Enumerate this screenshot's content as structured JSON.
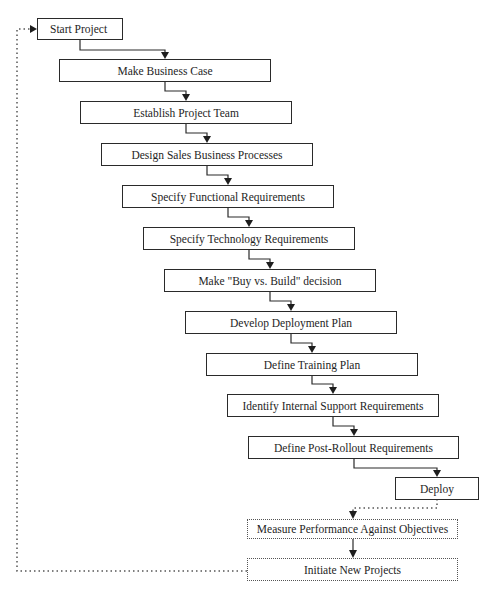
{
  "diagram": {
    "type": "flowchart",
    "steps": [
      {
        "id": "start",
        "label": "Start Project",
        "style": "solid"
      },
      {
        "id": "business-case",
        "label": "Make Business Case",
        "style": "solid"
      },
      {
        "id": "project-team",
        "label": "Establish Project Team",
        "style": "solid"
      },
      {
        "id": "sales-processes",
        "label": "Design Sales Business Processes",
        "style": "solid"
      },
      {
        "id": "functional-req",
        "label": "Specify Functional Requirements",
        "style": "solid"
      },
      {
        "id": "technology-req",
        "label": "Specify Technology Requirements",
        "style": "solid"
      },
      {
        "id": "buy-vs-build",
        "label": "Make \"Buy vs. Build\" decision",
        "style": "solid"
      },
      {
        "id": "deployment-plan",
        "label": "Develop Deployment Plan",
        "style": "solid"
      },
      {
        "id": "training-plan",
        "label": "Define Training Plan",
        "style": "solid"
      },
      {
        "id": "internal-support",
        "label": "Identify Internal Support Requirements",
        "style": "solid"
      },
      {
        "id": "post-rollout",
        "label": "Define Post-Rollout Requirements",
        "style": "solid"
      },
      {
        "id": "deploy",
        "label": "Deploy",
        "style": "solid"
      },
      {
        "id": "measure",
        "label": "Measure Performance Against Objectives",
        "style": "dotted"
      },
      {
        "id": "initiate",
        "label": "Initiate New Projects",
        "style": "dotted"
      }
    ],
    "connectors": [
      {
        "from": "start",
        "to": "business-case",
        "style": "solid"
      },
      {
        "from": "business-case",
        "to": "project-team",
        "style": "solid"
      },
      {
        "from": "project-team",
        "to": "sales-processes",
        "style": "solid"
      },
      {
        "from": "sales-processes",
        "to": "functional-req",
        "style": "solid"
      },
      {
        "from": "functional-req",
        "to": "technology-req",
        "style": "solid"
      },
      {
        "from": "technology-req",
        "to": "buy-vs-build",
        "style": "solid"
      },
      {
        "from": "buy-vs-build",
        "to": "deployment-plan",
        "style": "solid"
      },
      {
        "from": "deployment-plan",
        "to": "training-plan",
        "style": "solid"
      },
      {
        "from": "training-plan",
        "to": "internal-support",
        "style": "solid"
      },
      {
        "from": "internal-support",
        "to": "post-rollout",
        "style": "solid"
      },
      {
        "from": "post-rollout",
        "to": "deploy",
        "style": "solid"
      },
      {
        "from": "deploy",
        "to": "measure",
        "style": "dotted"
      },
      {
        "from": "measure",
        "to": "initiate",
        "style": "solid"
      },
      {
        "from": "initiate",
        "to": "start",
        "style": "dotted",
        "note": "feedback loop"
      }
    ],
    "colors": {
      "line": "#2a2a2a",
      "dotted_line": "#555555",
      "text": "#1e1e1e",
      "background": "#ffffff"
    }
  }
}
